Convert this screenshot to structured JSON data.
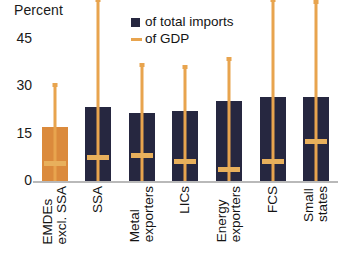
{
  "chart_data": {
    "type": "bar",
    "title": "",
    "ylabel": "Percent",
    "xlabel": "",
    "ylim": [
      0,
      45
    ],
    "yticks": [
      0,
      15,
      30,
      45
    ],
    "ytick_labels": [
      "0",
      "15",
      "30",
      "45"
    ],
    "grid": false,
    "legend_position": "top-right",
    "categories": [
      "EMDEs excl. SSA",
      "SSA",
      "Metal exporters",
      "LICs",
      "Energy exporters",
      "FCS",
      "Small states"
    ],
    "category_lines": [
      [
        "EMDEs",
        "excl. SSA"
      ],
      [
        "SSA",
        ""
      ],
      [
        "Metal",
        "exporters"
      ],
      [
        "LICs",
        ""
      ],
      [
        "Energy",
        "exporters"
      ],
      [
        "FCS",
        ""
      ],
      [
        "Small",
        "states"
      ]
    ],
    "series": [
      {
        "name": "of total imports",
        "type": "bar",
        "color": "#262740",
        "highlight_color": "#db8a3c",
        "values": [
          13.5,
          18.5,
          17.0,
          17.5,
          20.0,
          21.0,
          21.0
        ]
      },
      {
        "name": "of GDP",
        "type": "range",
        "color": "#e8a44e",
        "low": [
          0,
          0,
          0,
          0,
          0,
          0,
          0
        ],
        "high": [
          24.0,
          45.0,
          29.0,
          28.5,
          30.5,
          45.0,
          44.5
        ],
        "median": [
          4.5,
          6.0,
          6.5,
          5.0,
          3.0,
          5.0,
          10.0
        ]
      }
    ]
  },
  "legend": {
    "items": [
      {
        "label": "of total imports",
        "marker": "square-marker",
        "color": "#262740"
      },
      {
        "label": "of GDP",
        "marker": "dash-marker",
        "color": "#e8a44e"
      }
    ]
  },
  "axis": {
    "y_title": "Percent",
    "tick_45": "45",
    "tick_30": "30",
    "tick_15": "15",
    "tick_0": "0"
  }
}
